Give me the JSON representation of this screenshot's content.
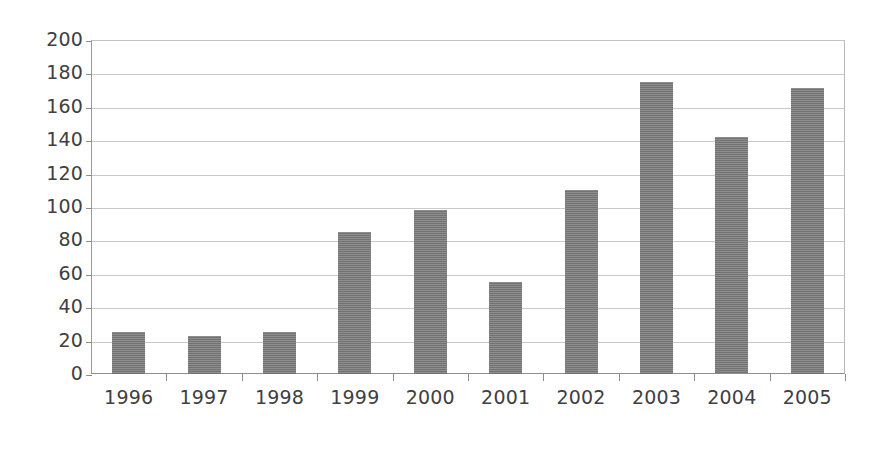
{
  "chart_data": {
    "type": "bar",
    "title": "",
    "subtitle": "",
    "xlabel": "",
    "ylabel": "",
    "categories": [
      "1996",
      "1997",
      "1998",
      "1999",
      "2000",
      "2001",
      "2002",
      "2003",
      "2004",
      "2005"
    ],
    "values": [
      25,
      23,
      25,
      85,
      98,
      55,
      110,
      175,
      142,
      171
    ],
    "ylim": [
      0,
      200
    ],
    "ytick_labels": [
      "200",
      "180",
      "160",
      "140",
      "120",
      "100",
      "80",
      "60",
      "40",
      "20",
      "0"
    ],
    "ytick_values": [
      200,
      180,
      160,
      140,
      120,
      100,
      80,
      60,
      40,
      20,
      0
    ],
    "ytick_step": 20,
    "grid": true,
    "grid_axis": "y",
    "legend": false,
    "legend_position": "none",
    "series": [
      {
        "name": "",
        "values": [
          25,
          23,
          25,
          85,
          98,
          55,
          110,
          175,
          142,
          171
        ]
      }
    ],
    "colors": {
      "bar_fill": "#787878",
      "gridline": "#c9c9c9",
      "axis": "#8e8e8e",
      "text": "#404040",
      "background": "#ffffff"
    }
  }
}
